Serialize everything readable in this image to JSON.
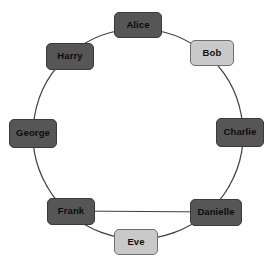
{
  "diagram": {
    "type": "ring-graph",
    "background_color": "#fefefe",
    "canvas": {
      "width": 277,
      "height": 268
    },
    "circle": {
      "center_x": 138,
      "center_y": 134,
      "radius": 105
    },
    "palette": {
      "node_dark": "#565656",
      "node_light": "#c9c9c9",
      "node_border_dark": "#3a3a3a",
      "node_border_light": "#6f6f6f",
      "label_text": "#0c0c0c",
      "edge_stroke": "#3f3f3f"
    },
    "edge_stroke_width": 1.2,
    "nodes": [
      {
        "id": "alice",
        "label": "Alice",
        "x": 138,
        "y": 25,
        "w": 48,
        "h": 26,
        "fill": "dark",
        "angle_deg": -90
      },
      {
        "id": "bob",
        "label": "Bob",
        "x": 212,
        "y": 53,
        "w": 44,
        "h": 26,
        "fill": "light",
        "angle_deg": -50
      },
      {
        "id": "charlie",
        "label": "Charlie",
        "x": 240,
        "y": 132,
        "w": 48,
        "h": 29,
        "fill": "dark",
        "angle_deg": -10
      },
      {
        "id": "danielle",
        "label": "Danielle",
        "x": 216,
        "y": 212,
        "w": 52,
        "h": 27,
        "fill": "dark",
        "angle_deg": 30
      },
      {
        "id": "eve",
        "label": "Eve",
        "x": 136,
        "y": 242,
        "w": 44,
        "h": 26,
        "fill": "light",
        "angle_deg": 70
      },
      {
        "id": "frank",
        "label": "Frank",
        "x": 71,
        "y": 211,
        "w": 48,
        "h": 27,
        "fill": "dark",
        "angle_deg": 110
      },
      {
        "id": "george",
        "label": "George",
        "x": 33,
        "y": 133,
        "w": 48,
        "h": 29,
        "fill": "dark",
        "angle_deg": 150
      },
      {
        "id": "harry",
        "label": "Harry",
        "x": 70,
        "y": 56,
        "w": 48,
        "h": 27,
        "fill": "dark",
        "angle_deg": 190
      }
    ],
    "edges": [
      {
        "id": "edge-alice-bob",
        "from": "alice",
        "to": "bob",
        "shape": "arc"
      },
      {
        "id": "edge-bob-charlie",
        "from": "bob",
        "to": "charlie",
        "shape": "arc"
      },
      {
        "id": "edge-charlie-danielle",
        "from": "charlie",
        "to": "danielle",
        "shape": "arc"
      },
      {
        "id": "edge-danielle-eve",
        "from": "danielle",
        "to": "eve",
        "shape": "arc"
      },
      {
        "id": "edge-eve-frank",
        "from": "eve",
        "to": "frank",
        "shape": "arc"
      },
      {
        "id": "edge-frank-george",
        "from": "frank",
        "to": "george",
        "shape": "arc"
      },
      {
        "id": "edge-george-harry",
        "from": "george",
        "to": "harry",
        "shape": "arc"
      },
      {
        "id": "edge-harry-alice",
        "from": "harry",
        "to": "alice",
        "shape": "arc"
      },
      {
        "id": "edge-frank-danielle",
        "from": "frank",
        "to": "danielle",
        "shape": "chord"
      }
    ]
  }
}
